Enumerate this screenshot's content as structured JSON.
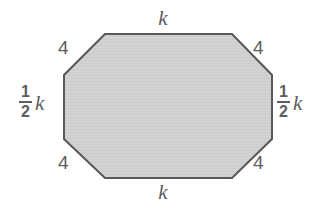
{
  "figure": {
    "shape_name": "octagon",
    "fill_color": "#d2d2d2",
    "stroke_color": "#585858",
    "background_color": "#ffffff",
    "stroke_width": 2
  },
  "labels": {
    "top_side": "k",
    "bottom_side": "k",
    "corner_top_left": "4",
    "corner_top_right": "4",
    "corner_bottom_left": "4",
    "corner_bottom_right": "4",
    "left_side": {
      "numerator": "1",
      "denominator": "2",
      "variable": "k"
    },
    "right_side": {
      "numerator": "1",
      "denominator": "2",
      "variable": "k"
    }
  },
  "geometry": {
    "vertices": [
      [
        105,
        34
      ],
      [
        232,
        34
      ],
      [
        272,
        75
      ],
      [
        272,
        139
      ],
      [
        232,
        178
      ],
      [
        105,
        178
      ],
      [
        64,
        139
      ],
      [
        64,
        75
      ]
    ],
    "points_attr": "105,34 232,34 272,75 272,139 232,178 105,178 64,139 64,75"
  }
}
